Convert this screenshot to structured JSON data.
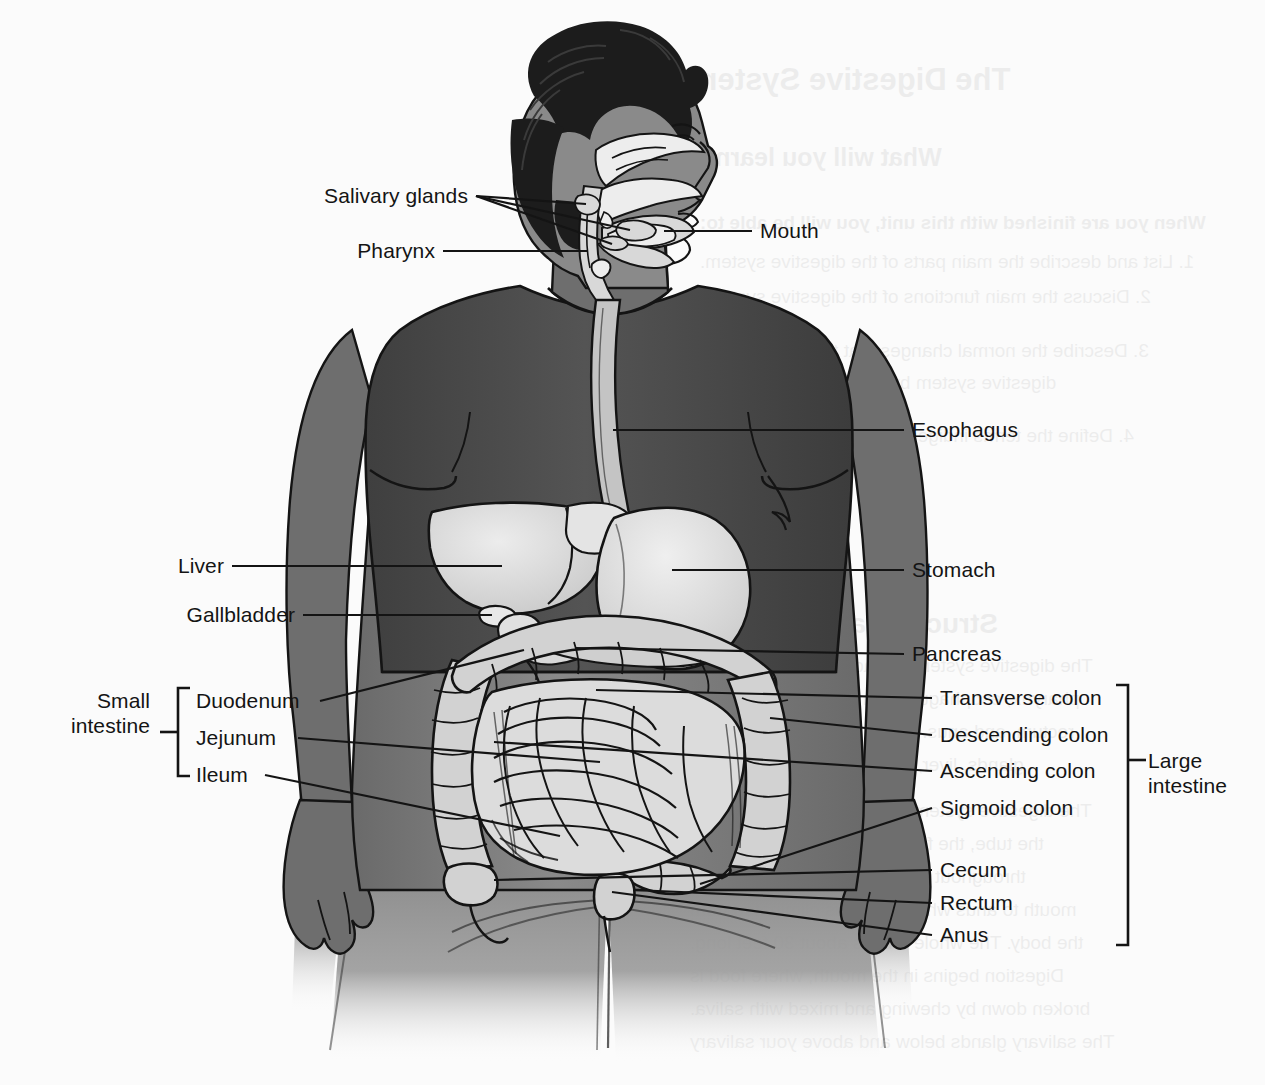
{
  "diagram": {
    "view": "anterior full-body figure with sagittal head cutaway",
    "background_color": "#fbfbfb",
    "line_color": "#141414",
    "palette": {
      "hair": "#1c1c1c",
      "shirt": "#4a4a4a",
      "skin_shadow": "#6e6e6e",
      "skin": "#8a8a8a",
      "organ_light": "#d8d8d8",
      "organ_mid": "#bfbfbf",
      "organ_pale": "#ededed",
      "outline": "#141414"
    }
  },
  "labels": {
    "left": [
      {
        "id": "salivary-glands",
        "text": "Salivary glands",
        "x": 322,
        "y": 183,
        "anchor_x": 476,
        "anchor_y": 196
      },
      {
        "id": "pharynx",
        "text": "Pharynx",
        "x": 322,
        "y": 238,
        "anchor_x": 443,
        "anchor_y": 251
      },
      {
        "id": "liver",
        "text": "Liver",
        "x": 175,
        "y": 553,
        "anchor_x": 232,
        "anchor_y": 566
      },
      {
        "id": "gallbladder",
        "text": "Gallbladder",
        "x": 175,
        "y": 602,
        "anchor_x": 303,
        "anchor_y": 615
      },
      {
        "id": "duodenum",
        "text": "Duodenum",
        "x": 196,
        "y": 688,
        "anchor_x": 320,
        "anchor_y": 701
      },
      {
        "id": "jejunum",
        "text": "Jejunum",
        "x": 196,
        "y": 725,
        "anchor_x": 298,
        "anchor_y": 738
      },
      {
        "id": "ileum",
        "text": "Ileum",
        "x": 196,
        "y": 762,
        "anchor_x": 265,
        "anchor_y": 775
      }
    ],
    "right": [
      {
        "id": "mouth",
        "text": "Mouth",
        "x": 760,
        "y": 218,
        "anchor_x": 752,
        "anchor_y": 231
      },
      {
        "id": "esophagus",
        "text": "Esophagus",
        "x": 912,
        "y": 417,
        "anchor_x": 904,
        "anchor_y": 430
      },
      {
        "id": "stomach",
        "text": "Stomach",
        "x": 912,
        "y": 557,
        "anchor_x": 904,
        "anchor_y": 570
      },
      {
        "id": "pancreas",
        "text": "Pancreas",
        "x": 912,
        "y": 641,
        "anchor_x": 904,
        "anchor_y": 654
      },
      {
        "id": "transverse-colon",
        "text": "Transverse colon",
        "x": 940,
        "y": 685,
        "anchor_x": 932,
        "anchor_y": 698
      },
      {
        "id": "descending-colon",
        "text": "Descending colon",
        "x": 940,
        "y": 722,
        "anchor_x": 932,
        "anchor_y": 735
      },
      {
        "id": "ascending-colon",
        "text": "Ascending colon",
        "x": 940,
        "y": 758,
        "anchor_x": 932,
        "anchor_y": 771
      },
      {
        "id": "sigmoid-colon",
        "text": "Sigmoid colon",
        "x": 940,
        "y": 795,
        "anchor_x": 932,
        "anchor_y": 808
      },
      {
        "id": "cecum",
        "text": "Cecum",
        "x": 940,
        "y": 857,
        "anchor_x": 932,
        "anchor_y": 870
      },
      {
        "id": "rectum",
        "text": "Rectum",
        "x": 940,
        "y": 890,
        "anchor_x": 932,
        "anchor_y": 903
      },
      {
        "id": "anus",
        "text": "Anus",
        "x": 940,
        "y": 922,
        "anchor_x": 932,
        "anchor_y": 935
      }
    ],
    "groups": [
      {
        "id": "small-intestine",
        "line1": "Small",
        "line2": "intestine",
        "x": 35,
        "y": 688,
        "bracket_x": 178,
        "bracket_top": 688,
        "bracket_bottom": 776,
        "tick_y": 732,
        "side": "left"
      },
      {
        "id": "large-intestine",
        "line1": "Large",
        "line2": "intestine",
        "x": 1148,
        "y": 748,
        "bracket_x": 1128,
        "bracket_top": 685,
        "bracket_bottom": 945,
        "tick_y": 760,
        "side": "right"
      }
    ]
  },
  "showthrough": {
    "note": "faint mirrored bleed-through from reverse of printed page",
    "items": [
      {
        "text": "The Digestive System",
        "x": 690,
        "y": 62,
        "size": 31,
        "weight": "bold"
      },
      {
        "text": "What will you learn?",
        "x": 700,
        "y": 143,
        "size": 25,
        "weight": "bold"
      },
      {
        "text": "When you are finished with this unit, you will be able to:",
        "x": 700,
        "y": 212,
        "size": 19,
        "weight": "bold"
      },
      {
        "text": "1. List and describe the main parts of the digestive system.",
        "x": 700,
        "y": 251,
        "size": 19,
        "weight": "normal"
      },
      {
        "text": "2. Discuss the main functions of the digestive system.",
        "x": 700,
        "y": 286,
        "size": 19,
        "weight": "normal"
      },
      {
        "text": "3. Describe the normal changes that take place in the",
        "x": 700,
        "y": 340,
        "size": 19,
        "weight": "normal"
      },
      {
        "text": "digestive system by the aging process.",
        "x": 730,
        "y": 372,
        "size": 19,
        "weight": "normal"
      },
      {
        "text": "4. Define the terms indigestion, heartburn, diarrhea,",
        "x": 700,
        "y": 425,
        "size": 19,
        "weight": "normal"
      },
      {
        "text": "and constipation.",
        "x": 730,
        "y": 457,
        "size": 19,
        "weight": "normal"
      },
      {
        "text": "Structure and Function",
        "x": 690,
        "y": 608,
        "size": 28,
        "weight": "bold"
      },
      {
        "text": "The digestive system is made up of the mouth,",
        "x": 700,
        "y": 655,
        "size": 19,
        "weight": "normal"
      },
      {
        "text": "pharynx, esophagus, stomach, small intestine,",
        "x": 690,
        "y": 688,
        "size": 19,
        "weight": "normal"
      },
      {
        "text": "rectum, and anus. It also includes the salivary",
        "x": 690,
        "y": 721,
        "size": 19,
        "weight": "normal"
      },
      {
        "text": "glands, liver, gallbladder, and pancreas.",
        "x": 690,
        "y": 754,
        "size": 19,
        "weight": "normal"
      },
      {
        "text": "The digestive system is one long tube made of",
        "x": 700,
        "y": 800,
        "size": 19,
        "weight": "normal"
      },
      {
        "text": "the tube, the food is or the gastrointestinal",
        "x": 690,
        "y": 833,
        "size": 19,
        "weight": "normal"
      },
      {
        "text": "throughout the digestive tract, food from",
        "x": 690,
        "y": 866,
        "size": 19,
        "weight": "normal"
      },
      {
        "text": "mouth to anus where waste is eliminated from",
        "x": 690,
        "y": 899,
        "size": 19,
        "weight": "normal"
      },
      {
        "text": "the body. The whole tube is about 30 feet long.",
        "x": 690,
        "y": 932,
        "size": 19,
        "weight": "normal"
      },
      {
        "text": "Digestion begins in the mouth, where food is",
        "x": 690,
        "y": 965,
        "size": 19,
        "weight": "normal"
      },
      {
        "text": "broken down by chewing and mixed with saliva.",
        "x": 690,
        "y": 998,
        "size": 19,
        "weight": "normal"
      },
      {
        "text": "The salivary glands below and above your salivary",
        "x": 690,
        "y": 1031,
        "size": 19,
        "weight": "normal"
      }
    ]
  }
}
